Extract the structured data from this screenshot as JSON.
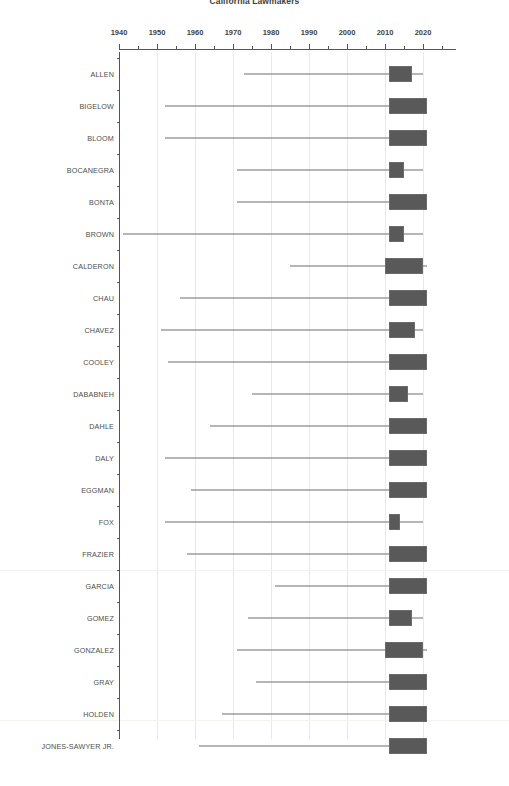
{
  "chart_data": {
    "type": "box",
    "title": "California Lawmakers",
    "xlabel": "",
    "ylabel": "",
    "xlim": [
      1938,
      2026
    ],
    "grid": true,
    "legend": "none",
    "orientation": "horizontal",
    "x_tick_labels": [
      "1940",
      "1950",
      "1960",
      "1970",
      "1980",
      "1990",
      "2000",
      "2010",
      "2020"
    ],
    "x_major_ticks": [
      1940,
      1950,
      1960,
      1970,
      1980,
      1990,
      2000,
      2010,
      2020
    ],
    "x_minor_ticks": [
      1945,
      1955,
      1965,
      1975,
      1985,
      1995,
      2005,
      2015,
      2025
    ],
    "categories": [
      "ALLEN",
      "BIGELOW",
      "BLOOM",
      "BOCANEGRA",
      "BONTA",
      "BROWN",
      "CALDERON",
      "CHAU",
      "CHAVEZ",
      "COOLEY",
      "DABABNEH",
      "DAHLE",
      "DALY",
      "EGGMAN",
      "FOX",
      "FRAZIER",
      "GARCIA",
      "GOMEZ",
      "GONZALEZ",
      "GRAY",
      "HOLDEN",
      "JONES-SAWYER JR."
    ],
    "boxes": [
      {
        "label": "ALLEN",
        "whisker_low": 1973,
        "q1": 2011,
        "q3": 2017,
        "whisker_high": 2020
      },
      {
        "label": "BIGELOW",
        "whisker_low": 1952,
        "q1": 2011,
        "q3": 2021,
        "whisker_high": 2021
      },
      {
        "label": "BLOOM",
        "whisker_low": 1952,
        "q1": 2011,
        "q3": 2021,
        "whisker_high": 2021
      },
      {
        "label": "BOCANEGRA",
        "whisker_low": 1971,
        "q1": 2011,
        "q3": 2015,
        "whisker_high": 2020
      },
      {
        "label": "BONTA",
        "whisker_low": 1971,
        "q1": 2011,
        "q3": 2021,
        "whisker_high": 2021
      },
      {
        "label": "BROWN",
        "whisker_low": 1941,
        "q1": 2011,
        "q3": 2015,
        "whisker_high": 2020
      },
      {
        "label": "CALDERON",
        "whisker_low": 1985,
        "q1": 2010,
        "q3": 2020,
        "whisker_high": 2021
      },
      {
        "label": "CHAU",
        "whisker_low": 1956,
        "q1": 2011,
        "q3": 2021,
        "whisker_high": 2021
      },
      {
        "label": "CHAVEZ",
        "whisker_low": 1951,
        "q1": 2011,
        "q3": 2018,
        "whisker_high": 2020
      },
      {
        "label": "COOLEY",
        "whisker_low": 1953,
        "q1": 2011,
        "q3": 2021,
        "whisker_high": 2021
      },
      {
        "label": "DABABNEH",
        "whisker_low": 1975,
        "q1": 2011,
        "q3": 2016,
        "whisker_high": 2020
      },
      {
        "label": "DAHLE",
        "whisker_low": 1964,
        "q1": 2011,
        "q3": 2021,
        "whisker_high": 2021
      },
      {
        "label": "DALY",
        "whisker_low": 1952,
        "q1": 2011,
        "q3": 2021,
        "whisker_high": 2021
      },
      {
        "label": "EGGMAN",
        "whisker_low": 1959,
        "q1": 2011,
        "q3": 2021,
        "whisker_high": 2021
      },
      {
        "label": "FOX",
        "whisker_low": 1952,
        "q1": 2011,
        "q3": 2014,
        "whisker_high": 2020
      },
      {
        "label": "FRAZIER",
        "whisker_low": 1958,
        "q1": 2011,
        "q3": 2021,
        "whisker_high": 2021
      },
      {
        "label": "GARCIA",
        "whisker_low": 1981,
        "q1": 2011,
        "q3": 2021,
        "whisker_high": 2021
      },
      {
        "label": "GOMEZ",
        "whisker_low": 1974,
        "q1": 2011,
        "q3": 2017,
        "whisker_high": 2020
      },
      {
        "label": "GONZALEZ",
        "whisker_low": 1971,
        "q1": 2010,
        "q3": 2020,
        "whisker_high": 2021
      },
      {
        "label": "GRAY",
        "whisker_low": 1976,
        "q1": 2011,
        "q3": 2021,
        "whisker_high": 2021
      },
      {
        "label": "HOLDEN",
        "whisker_low": 1967,
        "q1": 2011,
        "q3": 2021,
        "whisker_high": 2021
      },
      {
        "label": "JONES-SAWYER JR.",
        "whisker_low": 1961,
        "q1": 2011,
        "q3": 2021,
        "whisker_high": 2021
      }
    ],
    "style": {
      "box_fill": "#595959",
      "box_edge": "#6b6b6b",
      "whisker_color": "#6e6e6e",
      "axis_color": "#555555",
      "grid_color": "#e9e9e9",
      "text_color": "#4d4d4d",
      "background": "#ffffff"
    }
  }
}
